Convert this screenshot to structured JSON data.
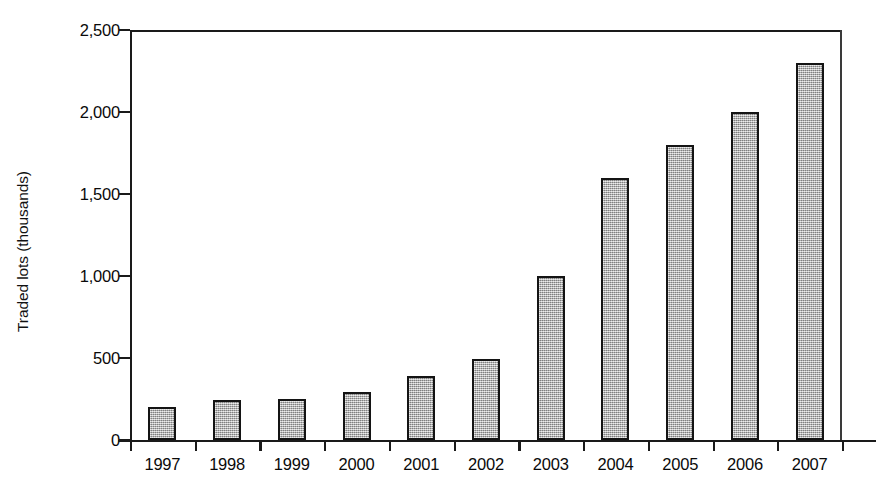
{
  "chart_data": {
    "type": "bar",
    "title": "",
    "subtitle": "",
    "xlabel": "",
    "ylabel": "Traded lots (thousands)",
    "categories": [
      "1997",
      "1998",
      "1999",
      "2000",
      "2001",
      "2002",
      "2003",
      "2004",
      "2005",
      "2006",
      "2007"
    ],
    "values": [
      200,
      245,
      250,
      295,
      390,
      495,
      1000,
      1600,
      1800,
      2000,
      2300
    ],
    "series": [
      {
        "name": "Traded lots",
        "values": [
          200,
          245,
          250,
          295,
          390,
          495,
          1000,
          1600,
          1800,
          2000,
          2300
        ]
      }
    ],
    "ylim": [
      0,
      2500
    ],
    "ytick_values": [
      0,
      500,
      1000,
      1500,
      2000,
      2500
    ],
    "ytick_labels": [
      "0",
      "500",
      "1,000",
      "1,500",
      "2,000",
      "2,500"
    ],
    "grid": false,
    "legend": false,
    "legend_position": "none",
    "annotations": [],
    "bar_fill_color": "#a9a9a9",
    "bar_edge_color": "#141414",
    "axis_color": "#1a1a1a",
    "background_color": "#ffffff"
  }
}
